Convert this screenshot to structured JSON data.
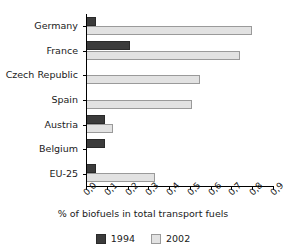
{
  "chart_data": {
    "type": "bar",
    "orientation": "horizontal",
    "title": "",
    "xlabel": "% of biofuels in total transport fuels",
    "ylabel": "",
    "xlim": [
      0.0,
      0.9
    ],
    "grid": false,
    "legend_position": "bottom",
    "xticks": [
      "0,0",
      "0,1",
      "0,2",
      "0,3",
      "0,4",
      "0,5",
      "0,6",
      "0,7",
      "0,8",
      "0,9"
    ],
    "xtick_values": [
      0.0,
      0.1,
      0.2,
      0.3,
      0.4,
      0.5,
      0.6,
      0.7,
      0.8,
      0.9
    ],
    "categories": [
      "Germany",
      "France",
      "Czech Republic",
      "Spain",
      "Austria",
      "Belgium",
      "EU-25"
    ],
    "series": [
      {
        "name": "1994",
        "color": "#3b3b3b",
        "values": [
          0.05,
          0.21,
          0.0,
          0.0,
          0.09,
          0.09,
          0.05
        ]
      },
      {
        "name": "2002",
        "color": "#e2e2e2",
        "values": [
          0.8,
          0.74,
          0.55,
          0.51,
          0.13,
          0.0,
          0.33
        ]
      }
    ]
  },
  "legend": {
    "items": [
      {
        "label": "1994"
      },
      {
        "label": "2002"
      }
    ]
  }
}
